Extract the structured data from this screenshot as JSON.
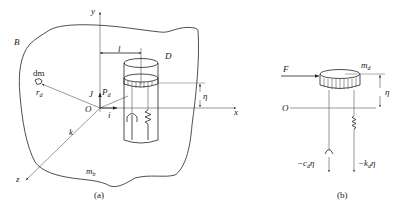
{
  "figure_a": {
    "caption": "(a)",
    "body_label": "B",
    "body_mass": "m",
    "body_mass_sub": "b",
    "absorber_label": "D",
    "axes": {
      "x": "x",
      "y": "y",
      "z": "z",
      "origin": "O"
    },
    "unit_vectors": {
      "i": "i",
      "J": "J",
      "k": "k"
    },
    "distance_label": "l",
    "point_label": "P",
    "point_sub": "d",
    "mass_element": "dm",
    "position_vector": "r",
    "position_sub": "d",
    "displacement": "η"
  },
  "figure_b": {
    "caption": "(b)",
    "force": "F",
    "mass": "m",
    "mass_sub": "d",
    "origin": "O",
    "displacement": "η",
    "damper_force": "−c",
    "damper_sub": "d",
    "damper_suffix": "η",
    "spring_force": "−k",
    "spring_sub": "d",
    "spring_suffix": "η"
  }
}
